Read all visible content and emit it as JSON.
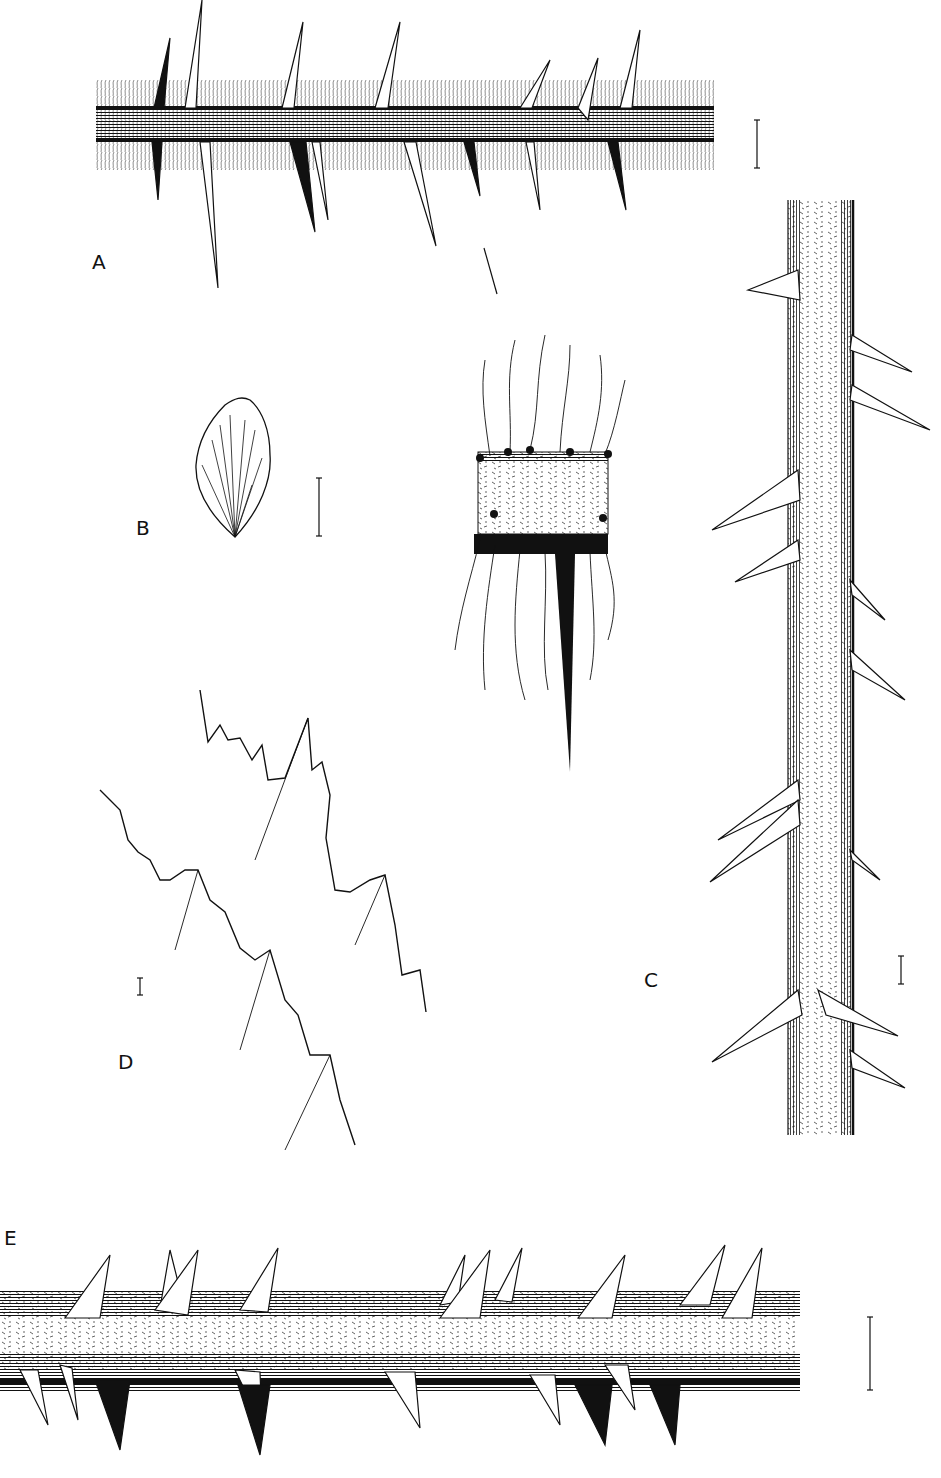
{
  "figure": {
    "type": "botanical-illustration-plate",
    "background": "#ffffff",
    "ink": "#111111",
    "panels": [
      {
        "id": "A",
        "label": "A",
        "subject": "hairy stem segment with slender prickles",
        "label_pos": [
          92,
          252
        ],
        "scale_bar": {
          "x": 757,
          "y1": 120,
          "y2": 168
        }
      },
      {
        "id": "B",
        "label": "B",
        "subject": "leaflet with palmate venation",
        "label_pos": [
          136,
          518
        ],
        "scale_bar": {
          "x": 319,
          "y1": 478,
          "y2": 536
        }
      },
      {
        "id": "inset",
        "label": "",
        "subject": "enlarged stem node with bristles and prickle",
        "label_pos": null,
        "scale_bar": null
      },
      {
        "id": "C",
        "label": "C",
        "subject": "vertical stem with hooked prickles",
        "label_pos": [
          644,
          970
        ],
        "scale_bar": {
          "x": 901,
          "y1": 956,
          "y2": 984
        }
      },
      {
        "id": "D",
        "label": "D",
        "subject": "serrated leaflet margins with glandular teeth",
        "label_pos": [
          118,
          1052
        ],
        "scale_bar": {
          "x": 140,
          "y1": 978,
          "y2": 995
        }
      },
      {
        "id": "E",
        "label": "E",
        "subject": "horizontal stem with broad-based prickles",
        "label_pos": [
          4,
          1228
        ],
        "scale_bar": {
          "x": 870,
          "y1": 1317,
          "y2": 1390
        }
      }
    ]
  }
}
